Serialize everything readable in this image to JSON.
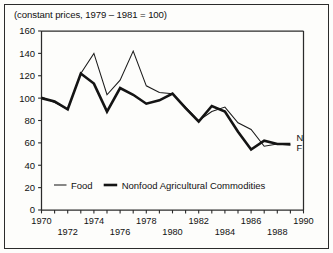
{
  "caption": "(constant prices, 1979 – 1981 = 100)",
  "end_labels": {
    "nonfood": "N",
    "food": "F"
  },
  "legend": {
    "items": [
      {
        "label": "Food",
        "style": "thin"
      },
      {
        "label": "Nonfood Agricultural Commodities",
        "style": "thick"
      }
    ]
  },
  "chart_data": {
    "type": "line",
    "title": "(constant prices, 1979 – 1981 = 100)",
    "xlabel": "",
    "ylabel": "",
    "xlim": [
      1970,
      1990
    ],
    "ylim": [
      0,
      160
    ],
    "ytick_values": [
      0,
      20,
      40,
      60,
      80,
      100,
      120,
      140,
      160
    ],
    "ytick_labels": [
      "0",
      "20",
      "40",
      "60",
      "80",
      "100",
      "120",
      "140",
      "160"
    ],
    "xtick_values": [
      1970,
      1971,
      1972,
      1973,
      1974,
      1975,
      1976,
      1977,
      1978,
      1979,
      1980,
      1981,
      1982,
      1983,
      1984,
      1985,
      1986,
      1987,
      1988,
      1989,
      1990
    ],
    "xtick_labels_upper": [
      {
        "year": 1970,
        "label": "1970"
      },
      {
        "year": 1974,
        "label": "1974"
      },
      {
        "year": 1978,
        "label": "1978"
      },
      {
        "year": 1982,
        "label": "1982"
      },
      {
        "year": 1986,
        "label": "1986"
      },
      {
        "year": 1990,
        "label": "1990"
      }
    ],
    "xtick_labels_lower": [
      {
        "year": 1972,
        "label": "1972"
      },
      {
        "year": 1976,
        "label": "1976"
      },
      {
        "year": 1980,
        "label": "1980"
      },
      {
        "year": 1984,
        "label": "1984"
      },
      {
        "year": 1988,
        "label": "1988"
      }
    ],
    "grid": false,
    "legend_position": "bottom-inside",
    "x": [
      1970,
      1971,
      1972,
      1973,
      1974,
      1975,
      1976,
      1977,
      1978,
      1979,
      1980,
      1981,
      1982,
      1983,
      1984,
      1985,
      1986,
      1987,
      1988,
      1989
    ],
    "series": [
      {
        "name": "Food",
        "style": "thin",
        "end_label": "F",
        "values": [
          101,
          96,
          90,
          122,
          140,
          103,
          116,
          142,
          111,
          105,
          104,
          92,
          80,
          88,
          92,
          78,
          72,
          57,
          59,
          58
        ]
      },
      {
        "name": "Nonfood Agricultural Commodities",
        "style": "thick",
        "end_label": "N",
        "values": [
          100,
          97,
          90,
          122,
          113,
          88,
          109,
          103,
          95,
          98,
          104,
          91,
          79,
          93,
          88,
          70,
          54,
          62,
          59,
          59
        ]
      }
    ]
  }
}
